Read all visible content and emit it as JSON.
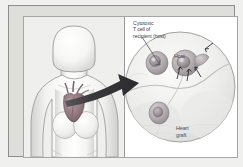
{
  "figure": {
    "title_alt": "Heart transplant rejection diagram",
    "background_color": "#f0f0ee",
    "plate_color": "#ffffff",
    "frame_color": "#8d8d8d"
  },
  "labels": {
    "cytotoxic_t_cell": "Cytotoxic\nT cell of\nrecipient (host)",
    "host": "Host",
    "heart_graft": "Heart\ngraft"
  },
  "panels": {
    "left": {
      "name": "human-torso-panel",
      "subject": "female upper body silhouette with heart",
      "background_color": "#efefed"
    },
    "right": {
      "name": "magnified-inset-panel",
      "subject": "circular magnified view of cells at graft interface",
      "background_color": "#ffffff",
      "inset_shape": "circle"
    }
  },
  "graphics": {
    "callout_arrow": "thick-tapered-arrow",
    "leader_line": "diagonal-pointer-line",
    "cell_arrows": 4,
    "colors": {
      "heart": "#8d7078",
      "arrow": "#3a3a3e",
      "cell": "#b9b2b4",
      "outline": "#8d8d8d"
    }
  }
}
